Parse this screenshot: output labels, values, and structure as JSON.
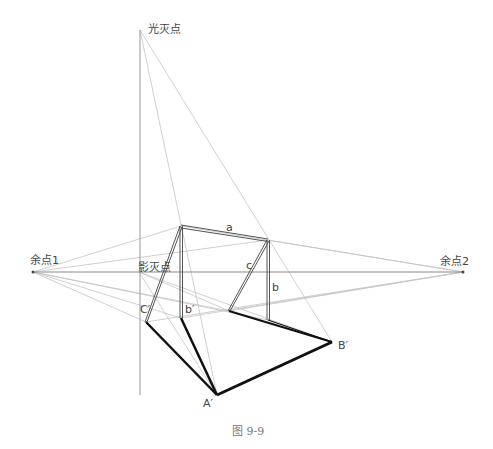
{
  "figure": {
    "caption": "图 9-9",
    "points": {
      "light_vanishing_point": {
        "label": "光灭点",
        "x": 140,
        "y": 30
      },
      "shadow_vanishing_point": {
        "label": "影灭点",
        "x": 139,
        "y": 272
      },
      "vp1": {
        "label": "余点1",
        "x": 33,
        "y": 272
      },
      "vp2": {
        "label": "余点2",
        "x": 463,
        "y": 272
      }
    },
    "edge_labels": {
      "a": "a",
      "b": "b",
      "c": "c",
      "b_prime": "b′",
      "A_prime": "A′",
      "B_prime": "B′",
      "C_prime": "C′"
    },
    "colors": {
      "construction": "#bdbdbd",
      "horizon": "#888888",
      "object": "#555555",
      "shadow": "#111111"
    }
  }
}
